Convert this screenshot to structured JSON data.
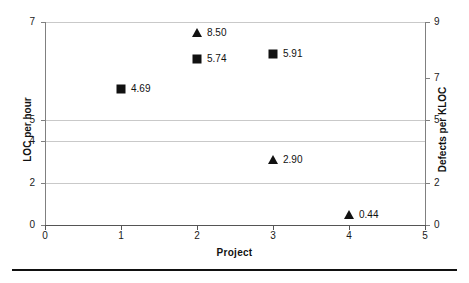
{
  "chart_data": {
    "type": "scatter",
    "title": "",
    "xlabel": "Project",
    "ylabel": "LOC per hour",
    "y2label": "Defects per KLOC",
    "xlim": [
      0,
      5
    ],
    "ylim": [
      0,
      7
    ],
    "y2lim": [
      0,
      9
    ],
    "grid": true,
    "legend": "none",
    "xticks": [
      "0",
      "1",
      "2",
      "3",
      "4",
      "5"
    ],
    "yticks": [
      "0",
      "2",
      "4",
      "5",
      "7"
    ],
    "y2ticks": [
      "0",
      "2",
      "5",
      "7",
      "9"
    ],
    "marker_color": "#111111",
    "gridline_color": "#c9c9c9",
    "axis_color": "#808080",
    "series": [
      {
        "name": "LOC per hour",
        "marker": "square",
        "axis": "left",
        "points": [
          {
            "x": 1,
            "y": 4.69,
            "label": "4.69"
          },
          {
            "x": 2,
            "y": 5.74,
            "label": "5.74"
          },
          {
            "x": 3,
            "y": 5.91,
            "label": "5.91"
          }
        ]
      },
      {
        "name": "Defects per KLOC",
        "marker": "triangle",
        "axis": "right",
        "points": [
          {
            "x": 2,
            "y": 8.5,
            "label": "8.50"
          },
          {
            "x": 3,
            "y": 2.9,
            "label": "2.90"
          },
          {
            "x": 4,
            "y": 0.44,
            "label": "0.44"
          }
        ]
      }
    ],
    "ytick_positions_px": [
      225,
      183,
      141,
      120,
      22
    ],
    "y2tick_positions_px": [
      225,
      183,
      120,
      78,
      22
    ],
    "xtick_positions_px": [
      45,
      121,
      197,
      273,
      349,
      425
    ]
  }
}
